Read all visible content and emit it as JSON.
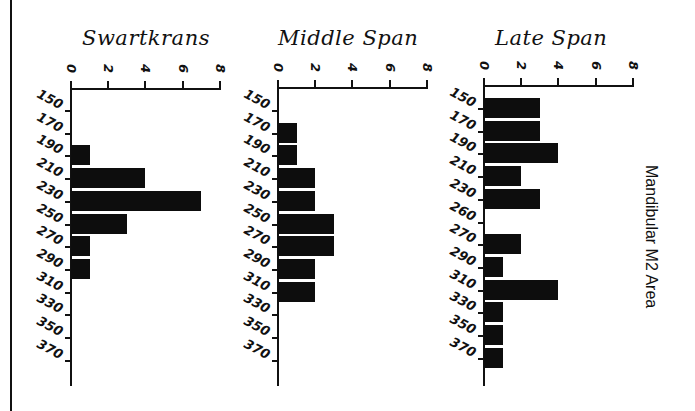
{
  "figure": {
    "side_label": "Mandibular M2 Area"
  },
  "chart_data": [
    {
      "type": "bar",
      "orientation": "horizontal",
      "title": "Swartkrans",
      "xlabel": "",
      "ylabel": "Mandibular M2 Area",
      "xlim": [
        0,
        8
      ],
      "x_ticks": [
        "0",
        "2",
        "4",
        "6",
        "8"
      ],
      "categories": [
        "150",
        "170",
        "190",
        "210",
        "230",
        "250",
        "270",
        "290",
        "310",
        "330",
        "350",
        "370"
      ],
      "values": [
        0,
        0,
        1,
        4,
        7,
        3,
        1,
        1,
        0,
        0,
        0,
        0
      ]
    },
    {
      "type": "bar",
      "orientation": "horizontal",
      "title": "Middle Span",
      "xlabel": "",
      "ylabel": "Mandibular M2 Area",
      "xlim": [
        0,
        8
      ],
      "x_ticks": [
        "0",
        "2",
        "4",
        "6",
        "8"
      ],
      "categories": [
        "150",
        "170",
        "190",
        "210",
        "230",
        "250",
        "270",
        "290",
        "310",
        "330",
        "350",
        "370"
      ],
      "values": [
        0,
        1,
        1,
        2,
        2,
        3,
        3,
        2,
        2,
        0,
        0,
        0
      ]
    },
    {
      "type": "bar",
      "orientation": "horizontal",
      "title": "Late Span",
      "xlabel": "",
      "ylabel": "Mandibular M2 Area",
      "xlim": [
        0,
        8
      ],
      "x_ticks": [
        "0",
        "2",
        "4",
        "6",
        "8"
      ],
      "categories": [
        "150",
        "170",
        "190",
        "210",
        "230",
        "260",
        "270",
        "290",
        "310",
        "330",
        "350",
        "370"
      ],
      "values": [
        3,
        3,
        4,
        2,
        3,
        0,
        2,
        1,
        4,
        1,
        1,
        1
      ]
    }
  ]
}
